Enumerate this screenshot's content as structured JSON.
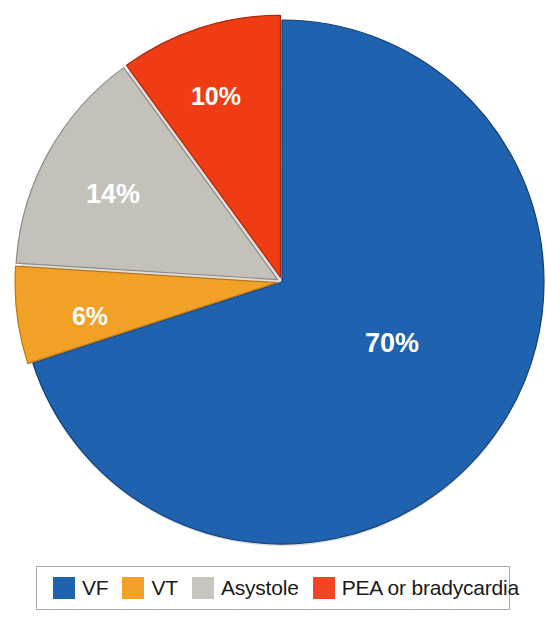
{
  "chart_data": {
    "type": "pie",
    "title": "",
    "categories": [
      "VF",
      "VT",
      "Asystole",
      "PEA or bradycardia"
    ],
    "values": [
      70,
      6,
      14,
      10
    ],
    "value_labels": [
      "70%",
      "6%",
      "14%",
      "10%"
    ],
    "colors": [
      "#1f63b0",
      "#f2a127",
      "#c3c1ba",
      "#f03c14"
    ],
    "legend_position": "bottom",
    "start_angle_deg": 0,
    "direction": "clockwise",
    "units": "percent",
    "grid": false,
    "xlabel": "",
    "ylabel": ""
  },
  "pie": {
    "center_x": 282,
    "center_y": 282,
    "radius": 262,
    "slices": [
      {
        "name": "VF",
        "value": 70,
        "label": "70%",
        "color": "#1f63b0",
        "edge_color": "#123f73",
        "start_deg": 0,
        "end_deg": 252,
        "label_x": 392,
        "label_y": 345
      },
      {
        "name": "VT",
        "value": 6,
        "label": "6%",
        "color": "#f2a127",
        "edge_color": "#b9761a",
        "start_deg": 252,
        "end_deg": 273.6,
        "label_x": 90,
        "label_y": 318
      },
      {
        "name": "Asystole",
        "value": 14,
        "label": "14%",
        "color": "#c3c1ba",
        "edge_color": "#8d8b85",
        "start_deg": 273.6,
        "end_deg": 324,
        "label_x": 113,
        "label_y": 196
      },
      {
        "name": "PEA or bradycardia",
        "value": 10,
        "label": "10%",
        "color": "#f03c14",
        "edge_color": "#a9280d",
        "start_deg": 324,
        "end_deg": 360,
        "label_x": 216,
        "label_y": 98
      }
    ]
  },
  "legend": {
    "items": [
      {
        "label": "VF",
        "color": "#1f63b0"
      },
      {
        "label": "VT",
        "color": "#f2a127"
      },
      {
        "label": "Asystole",
        "color": "#c7c5be"
      },
      {
        "label": "PEA or bradycardia",
        "color": "#f54423"
      }
    ],
    "border_color": "#a9a9a9"
  }
}
